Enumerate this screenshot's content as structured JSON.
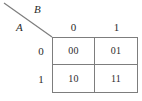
{
  "diagram": {
    "type": "karnaugh-map",
    "title": "",
    "row_variable": "A",
    "col_variable": "B",
    "col_headers": [
      "0",
      "1"
    ],
    "row_headers": [
      "0",
      "1"
    ],
    "cells": [
      [
        "00",
        "01"
      ],
      [
        "10",
        "11"
      ]
    ],
    "colors": {
      "line": "#7d7d7d",
      "text": "#2b2b2b",
      "background": "#ffffff"
    }
  }
}
